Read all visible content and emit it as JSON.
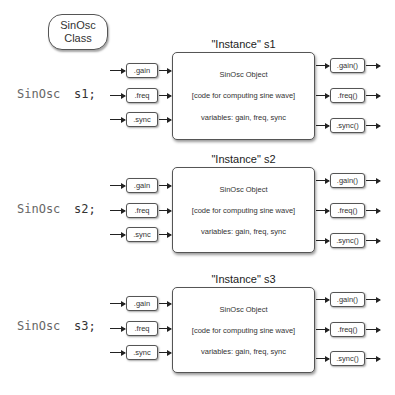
{
  "class_bubble": {
    "line1": "SinOsc",
    "line2": "Class"
  },
  "instances": [
    {
      "title": "\"Instance\" s1",
      "declaration": {
        "class_name": "SinOsc",
        "var_name": "s1;"
      },
      "object_lines": [
        "SinOsc Object",
        "[code for computing sine wave]",
        "variables: gain, freq, sync"
      ],
      "inputs": [
        ".gain",
        ".freq",
        ".sync"
      ],
      "outputs": [
        ".gain()",
        ".freq()",
        ".sync()"
      ]
    },
    {
      "title": "\"Instance\" s2",
      "declaration": {
        "class_name": "SinOsc",
        "var_name": "s2;"
      },
      "object_lines": [
        "SinOsc Object",
        "[code for computing sine wave]",
        "variables: gain, freq, sync"
      ],
      "inputs": [
        ".gain",
        ".freq",
        ".sync"
      ],
      "outputs": [
        ".gain()",
        ".freq()",
        ".sync()"
      ]
    },
    {
      "title": "\"Instance\" s3",
      "declaration": {
        "class_name": "SinOsc",
        "var_name": "s3;"
      },
      "object_lines": [
        "SinOsc Object",
        "[code for computing sine wave]",
        "variables: gain, freq, sync"
      ],
      "inputs": [
        ".gain",
        ".freq",
        ".sync"
      ],
      "outputs": [
        ".gain()",
        ".freq()",
        ".sync()"
      ]
    }
  ]
}
